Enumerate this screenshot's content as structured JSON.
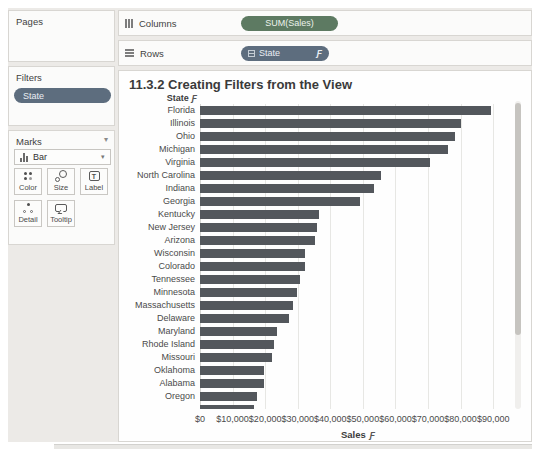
{
  "icons": {
    "filter": "Ƒ"
  },
  "colors": {
    "bar": "#53575c",
    "pill_green": "#5d7a62",
    "pill_blue": "#5d6d7e",
    "panel_bg": "#fbfbfa",
    "workspace_bg": "#eceae7"
  },
  "sidebar": {
    "pages": {
      "title": "Pages"
    },
    "filters": {
      "title": "Filters",
      "pills": [
        "State"
      ]
    },
    "marks": {
      "title": "Marks",
      "mark_type": "Bar",
      "buttons": [
        {
          "label": "Color"
        },
        {
          "label": "Size"
        },
        {
          "label": "Label"
        },
        {
          "label": "Detail"
        },
        {
          "label": "Tooltip"
        }
      ]
    }
  },
  "shelves": {
    "columns": {
      "label": "Columns",
      "pill": "SUM(Sales)"
    },
    "rows": {
      "label": "Rows",
      "pill": "State"
    }
  },
  "chart_data": {
    "type": "bar",
    "title": "11.3.2 Creating Filters from the View",
    "row_header": "State",
    "xlabel": "Sales",
    "categories": [
      "Florida",
      "Illinois",
      "Ohio",
      "Michigan",
      "Virginia",
      "North Carolina",
      "Indiana",
      "Georgia",
      "Kentucky",
      "New Jersey",
      "Arizona",
      "Wisconsin",
      "Colorado",
      "Tennessee",
      "Minnesota",
      "Massachusetts",
      "Delaware",
      "Maryland",
      "Rhode Island",
      "Missouri",
      "Oklahoma",
      "Alabama",
      "Oregon"
    ],
    "values": [
      89474,
      80166,
      78258,
      76270,
      70637,
      55603,
      53555,
      49096,
      36592,
      35764,
      35282,
      32115,
      32108,
      30662,
      29863,
      28634,
      27451,
      23706,
      22628,
      22205,
      19683,
      19511,
      17431
    ],
    "partial_bar_value": 16600,
    "x_ticks": [
      "$0",
      "$10,000",
      "$20,000",
      "$30,000",
      "$40,000",
      "$50,000",
      "$60,000",
      "$70,000",
      "$80,000",
      "$90,000"
    ],
    "x_tick_values": [
      0,
      10000,
      20000,
      30000,
      40000,
      50000,
      60000,
      70000,
      80000,
      90000
    ],
    "xlim": [
      0,
      97000
    ],
    "grid": true,
    "orientation": "horizontal"
  }
}
